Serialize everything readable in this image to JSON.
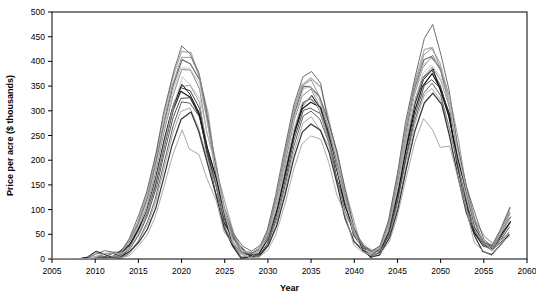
{
  "chart_data": {
    "type": "line",
    "title": "",
    "xlabel": "Year",
    "ylabel": "Price per acre ($ thousands)",
    "xlim": [
      2005,
      2060
    ],
    "ylim": [
      0,
      500
    ],
    "xticks": [
      2005,
      2010,
      2015,
      2020,
      2025,
      2030,
      2035,
      2040,
      2045,
      2050,
      2055,
      2060
    ],
    "yticks": [
      0,
      50,
      100,
      150,
      200,
      250,
      300,
      350,
      400,
      450,
      500
    ],
    "grid": false,
    "legend": null,
    "annotations": [],
    "x": [
      2005,
      2006,
      2007,
      2008,
      2009,
      2010,
      2011,
      2012,
      2013,
      2014,
      2015,
      2016,
      2017,
      2018,
      2019,
      2020,
      2021,
      2022,
      2023,
      2024,
      2025,
      2026,
      2027,
      2028,
      2029,
      2030,
      2031,
      2032,
      2033,
      2034,
      2035,
      2036,
      2037,
      2038,
      2039,
      2040,
      2041,
      2042,
      2043,
      2044,
      2045,
      2046,
      2047,
      2048,
      2049,
      2050,
      2051,
      2052,
      2053,
      2054,
      2055,
      2056,
      2057,
      2058
    ],
    "series": [
      {
        "name": "run-1",
        "color": "#111111",
        "values": [
          0,
          0,
          0,
          0,
          2,
          8,
          6,
          4,
          12,
          30,
          60,
          95,
          150,
          230,
          300,
          345,
          330,
          290,
          220,
          150,
          80,
          35,
          15,
          8,
          12,
          40,
          95,
          170,
          250,
          305,
          320,
          300,
          250,
          180,
          110,
          50,
          20,
          10,
          18,
          55,
          130,
          220,
          300,
          355,
          375,
          350,
          290,
          200,
          120,
          60,
          30,
          20,
          45,
          70
        ]
      },
      {
        "name": "run-2",
        "color": "#222222",
        "values": [
          0,
          0,
          0,
          0,
          0,
          5,
          10,
          6,
          10,
          25,
          55,
          100,
          165,
          245,
          310,
          350,
          340,
          300,
          230,
          155,
          85,
          38,
          14,
          7,
          15,
          45,
          100,
          180,
          260,
          315,
          330,
          305,
          255,
          185,
          115,
          55,
          22,
          12,
          20,
          60,
          140,
          235,
          320,
          370,
          385,
          355,
          295,
          205,
          125,
          65,
          32,
          22,
          50,
          80
        ]
      },
      {
        "name": "run-3",
        "color": "#333333",
        "values": [
          0,
          0,
          0,
          0,
          0,
          3,
          5,
          5,
          8,
          20,
          45,
          85,
          140,
          215,
          285,
          330,
          325,
          285,
          215,
          145,
          78,
          32,
          12,
          6,
          10,
          35,
          88,
          160,
          240,
          295,
          310,
          290,
          240,
          170,
          105,
          48,
          18,
          9,
          16,
          50,
          120,
          210,
          290,
          345,
          365,
          340,
          280,
          192,
          115,
          56,
          28,
          18,
          42,
          66
        ]
      },
      {
        "name": "run-4",
        "color": "#444444",
        "values": [
          0,
          0,
          0,
          0,
          0,
          2,
          4,
          3,
          6,
          16,
          38,
          72,
          124,
          196,
          268,
          318,
          318,
          280,
          210,
          140,
          72,
          30,
          10,
          5,
          9,
          30,
          80,
          150,
          228,
          285,
          300,
          282,
          232,
          164,
          100,
          44,
          16,
          8,
          14,
          45,
          112,
          200,
          280,
          335,
          355,
          330,
          272,
          185,
          110,
          52,
          26,
          16,
          38,
          60
        ]
      },
      {
        "name": "run-5",
        "color": "#666666",
        "values": [
          0,
          0,
          0,
          0,
          0,
          6,
          8,
          6,
          14,
          35,
          72,
          120,
          190,
          275,
          350,
          400,
          395,
          355,
          275,
          185,
          100,
          45,
          18,
          9,
          18,
          55,
          120,
          205,
          290,
          345,
          355,
          330,
          275,
          200,
          125,
          60,
          25,
          13,
          24,
          70,
          160,
          260,
          345,
          400,
          415,
          385,
          320,
          225,
          135,
          72,
          36,
          26,
          58,
          92
        ]
      },
      {
        "name": "run-6",
        "color": "#777777",
        "values": [
          0,
          0,
          0,
          0,
          0,
          4,
          7,
          5,
          11,
          28,
          62,
          108,
          175,
          258,
          330,
          382,
          380,
          340,
          262,
          175,
          94,
          42,
          16,
          8,
          16,
          50,
          112,
          195,
          278,
          332,
          345,
          320,
          266,
          192,
          120,
          57,
          23,
          11,
          22,
          66,
          152,
          250,
          334,
          392,
          408,
          378,
          312,
          218,
          130,
          68,
          34,
          24,
          55,
          88
        ]
      },
      {
        "name": "run-7",
        "color": "#888888",
        "values": [
          0,
          0,
          0,
          0,
          0,
          3,
          6,
          4,
          9,
          22,
          50,
          92,
          152,
          228,
          300,
          355,
          352,
          312,
          238,
          160,
          86,
          36,
          13,
          7,
          13,
          42,
          100,
          178,
          256,
          312,
          325,
          300,
          248,
          178,
          110,
          50,
          20,
          10,
          19,
          58,
          138,
          232,
          315,
          372,
          388,
          360,
          298,
          208,
          124,
          64,
          31,
          21,
          48,
          76
        ]
      },
      {
        "name": "run-8",
        "color": "#999999",
        "values": [
          0,
          0,
          0,
          0,
          0,
          2,
          3,
          3,
          5,
          14,
          34,
          66,
          115,
          185,
          255,
          305,
          308,
          272,
          205,
          136,
          70,
          28,
          9,
          4,
          8,
          26,
          72,
          140,
          216,
          272,
          288,
          270,
          222,
          158,
          96,
          42,
          15,
          7,
          13,
          42,
          106,
          192,
          272,
          326,
          346,
          322,
          265,
          180,
          106,
          50,
          24,
          15,
          36,
          58
        ]
      },
      {
        "name": "run-9",
        "color": "#aaaaaa",
        "values": [
          0,
          0,
          0,
          0,
          0,
          7,
          9,
          7,
          16,
          40,
          80,
          132,
          205,
          292,
          368,
          420,
          412,
          370,
          288,
          194,
          105,
          48,
          20,
          10,
          20,
          60,
          130,
          218,
          305,
          358,
          368,
          342,
          286,
          208,
          130,
          64,
          27,
          14,
          26,
          76,
          170,
          272,
          358,
          418,
          432,
          400,
          332,
          234,
          142,
          76,
          38,
          28,
          62,
          100
        ]
      },
      {
        "name": "run-10",
        "color": "#bbbbbb",
        "values": [
          0,
          0,
          0,
          0,
          0,
          5,
          8,
          6,
          13,
          32,
          68,
          114,
          182,
          266,
          340,
          392,
          388,
          348,
          268,
          180,
          96,
          43,
          17,
          8,
          17,
          52,
          116,
          200,
          284,
          338,
          350,
          326,
          270,
          196,
          122,
          58,
          24,
          12,
          23,
          68,
          156,
          254,
          340,
          396,
          412,
          382,
          316,
          222,
          132,
          70,
          35,
          25,
          56,
          90
        ]
      },
      {
        "name": "run-11",
        "color": "#555555",
        "values": [
          0,
          0,
          0,
          0,
          1,
          9,
          12,
          8,
          18,
          44,
          86,
          138,
          212,
          300,
          375,
          430,
          420,
          378,
          294,
          198,
          108,
          50,
          21,
          11,
          21,
          62,
          135,
          224,
          312,
          366,
          376,
          350,
          292,
          212,
          134,
          66,
          28,
          15,
          28,
          80,
          176,
          280,
          366,
          440,
          470,
          408,
          340,
          240,
          146,
          78,
          40,
          30,
          64,
          104
        ]
      },
      {
        "name": "run-12",
        "color": "#000000",
        "values": [
          0,
          0,
          0,
          0,
          3,
          10,
          7,
          5,
          11,
          27,
          58,
          98,
          158,
          238,
          308,
          352,
          336,
          296,
          224,
          152,
          82,
          36,
          14,
          7,
          14,
          44,
          98,
          176,
          254,
          310,
          326,
          302,
          252,
          182,
          112,
          52,
          21,
          11,
          19,
          57,
          134,
          228,
          312,
          362,
          378,
          350,
          292,
          202,
          122,
          62,
          31,
          21,
          47,
          74
        ]
      },
      {
        "name": "run-13",
        "color": "#2a2a2a",
        "values": [
          0,
          0,
          0,
          0,
          0,
          1,
          2,
          2,
          4,
          12,
          30,
          58,
          102,
          168,
          236,
          286,
          292,
          258,
          194,
          128,
          66,
          26,
          8,
          4,
          7,
          24,
          66,
          130,
          204,
          258,
          274,
          256,
          210,
          148,
          90,
          38,
          14,
          6,
          12,
          38,
          98,
          180,
          258,
          310,
          330,
          306,
          250,
          170,
          100,
          46,
          22,
          14,
          34,
          54
        ]
      },
      {
        "name": "run-14",
        "color": "#8a8a8a",
        "values": [
          0,
          0,
          0,
          0,
          0,
          6,
          11,
          7,
          15,
          37,
          75,
          125,
          196,
          282,
          356,
          408,
          402,
          362,
          280,
          188,
          102,
          46,
          19,
          9,
          19,
          58,
          126,
          212,
          298,
          352,
          362,
          336,
          280,
          204,
          128,
          62,
          26,
          13,
          25,
          73,
          165,
          266,
          352,
          410,
          424,
          392,
          326,
          230,
          138,
          74,
          37,
          27,
          60,
          96
        ]
      },
      {
        "name": "run-15",
        "color": "#c0c0c0",
        "values": [
          0,
          0,
          0,
          0,
          0,
          4,
          6,
          5,
          9,
          23,
          52,
          96,
          158,
          236,
          308,
          362,
          358,
          318,
          244,
          164,
          88,
          38,
          14,
          7,
          14,
          44,
          104,
          184,
          262,
          318,
          332,
          306,
          254,
          182,
          112,
          52,
          21,
          10,
          20,
          60,
          142,
          238,
          320,
          378,
          396,
          366,
          302,
          212,
          126,
          66,
          32,
          22,
          50,
          80
        ]
      },
      {
        "name": "run-16-low",
        "color": "#9a9a9a",
        "values": [
          0,
          0,
          0,
          0,
          0,
          1,
          2,
          1,
          3,
          9,
          24,
          48,
          88,
          148,
          212,
          258,
          228,
          212,
          170,
          116,
          58,
          22,
          6,
          3,
          5,
          18,
          54,
          112,
          182,
          236,
          252,
          236,
          192,
          134,
          80,
          32,
          11,
          5,
          10,
          32,
          86,
          162,
          236,
          284,
          258,
          230,
          225,
          150,
          88,
          40,
          19,
          12,
          30,
          48
        ]
      }
    ]
  }
}
